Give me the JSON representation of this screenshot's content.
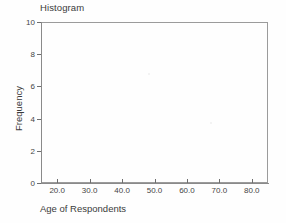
{
  "chart_data": {
    "type": "bar",
    "title": "Histogram",
    "xlabel": "Age of Respondents",
    "ylabel": "Frequency",
    "xlim": [
      15,
      85
    ],
    "ylim": [
      0,
      10
    ],
    "grid": false,
    "legend": null,
    "x_ticks": [
      "20.0",
      "30.0",
      "40.0",
      "50.0",
      "60.0",
      "70.0",
      "80.0"
    ],
    "x_tick_values": [
      20,
      30,
      40,
      50,
      60,
      70,
      80
    ],
    "y_ticks": [
      "10",
      "8",
      "6",
      "4",
      "2",
      "0"
    ],
    "y_tick_values": [
      10,
      8,
      6,
      4,
      2,
      0
    ],
    "categories": [],
    "values": [],
    "note": "plot area is empty - no bars rendered"
  },
  "colors": {
    "frame": "#9b9b9b",
    "axis": "#8a8a8a",
    "tick": "#6e6e6e",
    "text": "#3b3b3b",
    "tick_text": "#454545",
    "background": "#fefefe"
  }
}
